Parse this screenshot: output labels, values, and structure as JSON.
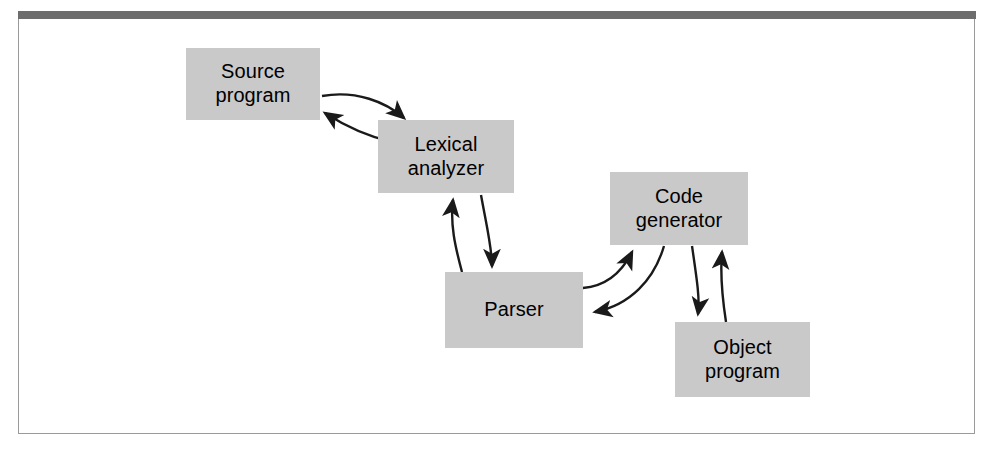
{
  "figure": {
    "background_color": "#ffffff",
    "frame_border_color": "#9a9a9a",
    "top_rule_color": "#6d6d6d",
    "box_fill_color": "#c9c9c9",
    "text_color": "#000000",
    "arrow_color": "#1a1a1a"
  },
  "diagram": {
    "type": "flow-diagram",
    "title": "",
    "nodes": [
      {
        "id": "source-program",
        "label": "Source\nprogram",
        "x": 186,
        "y": 48,
        "width": 134,
        "height": 72
      },
      {
        "id": "lexical-analyzer",
        "label": "Lexical\nanalyzer",
        "x": 378,
        "y": 120,
        "width": 136,
        "height": 73
      },
      {
        "id": "parser",
        "label": "Parser",
        "x": 445,
        "y": 272,
        "width": 138,
        "height": 76
      },
      {
        "id": "code-generator",
        "label": "Code\ngenerator",
        "x": 610,
        "y": 172,
        "width": 138,
        "height": 73
      },
      {
        "id": "object-program",
        "label": "Object\nprogram",
        "x": 675,
        "y": 322,
        "width": 135,
        "height": 75
      }
    ],
    "edges": [
      {
        "id": "source-to-lexical",
        "from": "source-program",
        "to": "lexical-analyzer",
        "direction": "forward"
      },
      {
        "id": "lexical-to-source",
        "from": "lexical-analyzer",
        "to": "source-program",
        "direction": "backward"
      },
      {
        "id": "lexical-to-parser",
        "from": "lexical-analyzer",
        "to": "parser",
        "direction": "forward"
      },
      {
        "id": "parser-to-lexical",
        "from": "parser",
        "to": "lexical-analyzer",
        "direction": "backward"
      },
      {
        "id": "parser-to-codegen",
        "from": "parser",
        "to": "code-generator",
        "direction": "forward"
      },
      {
        "id": "codegen-to-parser",
        "from": "code-generator",
        "to": "parser",
        "direction": "backward"
      },
      {
        "id": "codegen-to-object",
        "from": "code-generator",
        "to": "object-program",
        "direction": "forward"
      },
      {
        "id": "object-to-codegen",
        "from": "object-program",
        "to": "code-generator",
        "direction": "backward"
      }
    ]
  }
}
